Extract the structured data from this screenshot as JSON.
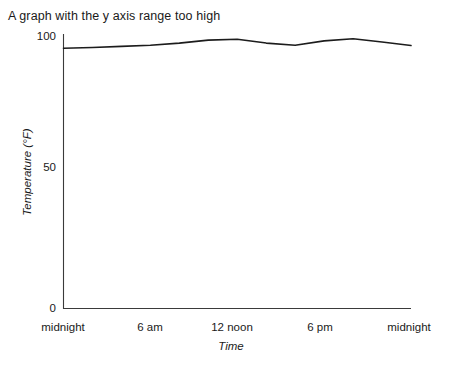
{
  "caption": "A graph with the y axis range too high",
  "colors": {
    "line": "#1c1c1c",
    "axis": "#3a3a3a",
    "text": "#1a1a1a",
    "background": "#ffffff"
  },
  "chart_data": {
    "type": "line",
    "title": "A graph with the y axis range too high",
    "xlabel": "Time",
    "ylabel": "Temperature (°F)",
    "xlim": [
      0,
      24
    ],
    "ylim": [
      0,
      100
    ],
    "grid": false,
    "legend": false,
    "x_tick_values": [
      0,
      6,
      12,
      18,
      24
    ],
    "x_tick_labels": [
      "midnight",
      "6 am",
      "12 noon",
      "6 pm",
      "midnight"
    ],
    "y_tick_values": [
      0,
      50,
      100
    ],
    "y_tick_labels": [
      "0",
      "50",
      "100"
    ],
    "x": [
      0,
      2,
      4,
      6,
      8,
      10,
      12,
      14,
      16,
      18,
      20,
      22,
      24
    ],
    "values": [
      95.5,
      95.8,
      96.2,
      96.6,
      97.4,
      98.5,
      98.8,
      97.4,
      96.6,
      98.2,
      99.0,
      97.8,
      96.5
    ],
    "series_name": "Temperature",
    "y_axis_note": "y axis spans 0 to 100 while data only varies between about 95 and 99"
  },
  "axis_labels": {
    "y": {
      "t0": "0",
      "t50": "50",
      "t100": "100",
      "title": "Temperature (°F)"
    },
    "x": {
      "t0": "midnight",
      "t6": "6 am",
      "t12": "12 noon",
      "t18": "6 pm",
      "t24": "midnight",
      "title": "Time"
    }
  }
}
